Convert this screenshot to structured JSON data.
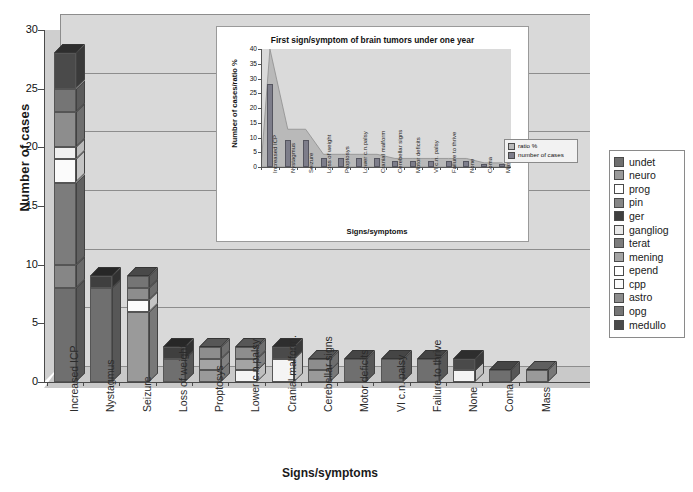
{
  "chart_data": {
    "type": "bar",
    "title": "",
    "xlabel": "Signs/symptoms",
    "ylabel": "Number of cases",
    "ylim": [
      0,
      30
    ],
    "yticks": [
      0,
      5,
      10,
      15,
      20,
      25,
      30
    ],
    "grid": true,
    "stacked": true,
    "legend_position": "right",
    "categories": [
      "Increased ICP",
      "Nystagmus",
      "Seizure",
      "Loss of weight",
      "Proptosys",
      "Lower c.n.palsy",
      "Cranial malform.",
      "Cerebellar signs",
      "Motor deficits",
      "VI c.n. palsy",
      "Failure to thrive",
      "None",
      "Coma",
      "Mass"
    ],
    "series": [
      {
        "name": "undet",
        "color": "#6f6f6f",
        "values": [
          8,
          8,
          0,
          2,
          0,
          0,
          0,
          0,
          2,
          2,
          2,
          0,
          1,
          0
        ]
      },
      {
        "name": "neuro",
        "color": "#9a9a9a",
        "values": [
          0,
          0,
          6,
          0,
          1,
          0,
          0,
          1,
          0,
          0,
          0,
          0,
          0,
          1
        ]
      },
      {
        "name": "prog",
        "color": "#f4f4f4",
        "values": [
          0,
          0,
          0,
          0,
          0,
          1,
          2,
          0,
          0,
          0,
          0,
          1,
          0,
          0
        ]
      },
      {
        "name": "pin",
        "color": "#868686",
        "values": [
          2,
          0,
          0,
          0,
          0,
          0,
          0,
          0,
          0,
          0,
          0,
          0,
          0,
          0
        ]
      },
      {
        "name": "ger",
        "color": "#3f3f3f",
        "values": [
          0,
          1,
          0,
          1,
          0,
          0,
          0,
          0,
          0,
          0,
          0,
          0,
          0,
          0
        ]
      },
      {
        "name": "gangliog",
        "color": "#e2e2e2",
        "values": [
          0,
          0,
          0,
          0,
          0,
          0,
          0,
          0,
          0,
          0,
          0,
          0,
          0,
          0
        ]
      },
      {
        "name": "terat",
        "color": "#7c7c7c",
        "values": [
          7,
          0,
          0,
          0,
          0,
          0,
          0,
          0,
          0,
          0,
          0,
          0,
          0,
          0
        ]
      },
      {
        "name": "mening",
        "color": "#a4a4a4",
        "values": [
          0,
          0,
          0,
          0,
          1,
          1,
          0,
          0,
          0,
          0,
          0,
          0,
          0,
          0
        ]
      },
      {
        "name": "epend",
        "color": "#fbfbfb",
        "values": [
          2,
          0,
          1,
          0,
          0,
          0,
          0,
          0,
          0,
          0,
          0,
          0,
          0,
          0
        ]
      },
      {
        "name": "cpp",
        "color": "#f0f0f0",
        "values": [
          1,
          0,
          0,
          0,
          0,
          0,
          0,
          0,
          0,
          0,
          0,
          0,
          0,
          0
        ]
      },
      {
        "name": "astro",
        "color": "#8d8d8d",
        "values": [
          3,
          0,
          1,
          0,
          1,
          1,
          0,
          1,
          0,
          0,
          0,
          0,
          0,
          0
        ]
      },
      {
        "name": "opg",
        "color": "#757575",
        "values": [
          2,
          0,
          1,
          0,
          0,
          0,
          0,
          0,
          0,
          0,
          0,
          0,
          0,
          0
        ]
      },
      {
        "name": "medullo",
        "color": "#4a4a4a",
        "values": [
          3,
          0,
          0,
          0,
          0,
          0,
          1,
          0,
          0,
          0,
          0,
          1,
          0,
          0
        ]
      }
    ],
    "totals": [
      28,
      9,
      9,
      3,
      3,
      3,
      3,
      2,
      2,
      2,
      2,
      2,
      1,
      1
    ]
  },
  "inset_chart": {
    "type": "bar",
    "title": "First sign/symptom of brain tumors under one year",
    "xlabel": "Signs/symptoms",
    "ylabel": "Number of cases/ratio %",
    "ylim": [
      0,
      40
    ],
    "yticks": [
      0,
      5,
      10,
      15,
      20,
      25,
      30,
      35,
      40
    ],
    "categories": [
      "Increased ICP",
      "Nystagmus",
      "Seizure",
      "Loss of weight",
      "Proptosys",
      "Lower c.n.palsy",
      "Cranial malform",
      "Cerebellar signs",
      "Motor deficits",
      "VI c.n. palsy",
      "Failure to thrive",
      "None",
      "Coma",
      "Mass"
    ],
    "series": [
      {
        "name": "ratio %",
        "color": "#b9b9b9",
        "values": [
          40,
          12.8,
          12.8,
          4.3,
          4.3,
          4.3,
          4.3,
          2.9,
          2.9,
          2.9,
          2.9,
          2.9,
          1.4,
          1.4
        ]
      },
      {
        "name": "number of cases",
        "color": "#7d7d8a",
        "values": [
          28,
          9,
          9,
          3,
          3,
          3,
          3,
          2,
          2,
          2,
          2,
          2,
          1,
          1
        ]
      }
    ],
    "legend": [
      "ratio %",
      "number of cases"
    ]
  },
  "legend": {
    "items": [
      {
        "label": "undet",
        "color": "#6f6f6f"
      },
      {
        "label": "neuro",
        "color": "#9a9a9a"
      },
      {
        "label": "prog",
        "color": "#ffffff"
      },
      {
        "label": "pin",
        "color": "#868686"
      },
      {
        "label": "ger",
        "color": "#3f3f3f"
      },
      {
        "label": "gangliog",
        "color": "#e8e8e8"
      },
      {
        "label": "terat",
        "color": "#7c7c7c"
      },
      {
        "label": "mening",
        "color": "#a4a4a4"
      },
      {
        "label": "epend",
        "color": "#ffffff"
      },
      {
        "label": "cpp",
        "color": "#fbfbfb"
      },
      {
        "label": "astro",
        "color": "#8d8d8d"
      },
      {
        "label": "opg",
        "color": "#757575"
      },
      {
        "label": "medullo",
        "color": "#4a4a4a"
      }
    ]
  },
  "colors": {
    "plot_background": "#d9d9d9",
    "page_background": "#ffffff",
    "gridline": "#8d8d8d",
    "axis": "#4a4a4a"
  }
}
